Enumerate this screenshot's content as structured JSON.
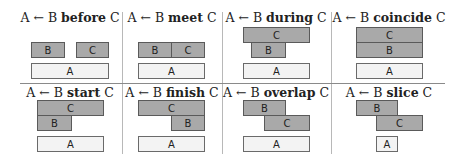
{
  "arrow": "←",
  "cells": [
    {
      "name": "before",
      "lhs": "A",
      "mid": "B",
      "rel": "before",
      "rhs": "C"
    },
    {
      "name": "meet",
      "lhs": "A",
      "mid": "B",
      "rel": "meet",
      "rhs": "C"
    },
    {
      "name": "during",
      "lhs": "A",
      "mid": "B",
      "rel": "during",
      "rhs": "C"
    },
    {
      "name": "coincide",
      "lhs": "A",
      "mid": "B",
      "rel": "coincide",
      "rhs": "C"
    },
    {
      "name": "start",
      "lhs": "A",
      "mid": "B",
      "rel": "start",
      "rhs": "C"
    },
    {
      "name": "finish",
      "lhs": "A",
      "mid": "B",
      "rel": "finish",
      "rhs": "C"
    },
    {
      "name": "overlap",
      "lhs": "A",
      "mid": "B",
      "rel": "overlap",
      "rhs": "C"
    },
    {
      "name": "slice",
      "lhs": "A",
      "mid": "B",
      "rel": "slice",
      "rhs": "C"
    }
  ],
  "labels": {
    "a": "A",
    "b": "B",
    "c": "C"
  },
  "colors": {
    "interval_fill": "#a9a9a9",
    "result_fill": "#f3f3f3",
    "border": "#5a5a5a"
  }
}
